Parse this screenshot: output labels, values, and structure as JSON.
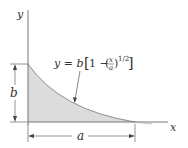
{
  "diagram": {
    "axes": {
      "x_label": "x",
      "y_label": "y"
    },
    "equation": {
      "lhs": "y = b",
      "bracket_open": "[",
      "one_minus": "1 − ",
      "frac_num": "x",
      "frac_den": "a",
      "exponent": "1/2",
      "bracket_close": "]"
    },
    "dimensions": {
      "height_label": "b",
      "width_label": "a"
    },
    "colors": {
      "fill": "#dcdcdc",
      "lines": "#555555"
    }
  }
}
